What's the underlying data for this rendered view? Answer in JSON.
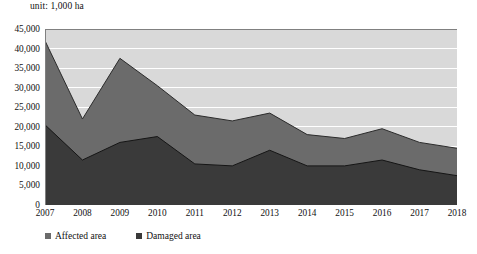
{
  "unit_label": "unit: 1,000 ha",
  "legend": {
    "items": [
      {
        "label": "Affected area",
        "color": "#6b6b6b",
        "swatch_icon": "square-marker-icon"
      },
      {
        "label": "Damaged area",
        "color": "#3a3a3a",
        "swatch_icon": "square-marker-icon"
      }
    ]
  },
  "axis": {
    "y_ticks": [
      "45,000",
      "40,000",
      "35,000",
      "30,000",
      "25,000",
      "20,000",
      "15,000",
      "10,000",
      "5,000",
      "0"
    ],
    "x_ticks": [
      "2007",
      "2008",
      "2009",
      "2010",
      "2011",
      "2012",
      "2013",
      "2014",
      "2015",
      "2016",
      "2017",
      "2018"
    ]
  },
  "chart_data": {
    "type": "area",
    "title": "",
    "subtitle": "",
    "xlabel": "",
    "ylabel": "",
    "unit": "unit: 1,000 ha",
    "stacked": false,
    "overlap": true,
    "grid": true,
    "legend_position": "bottom-left",
    "ylim": [
      0,
      45000
    ],
    "ytick_step": 5000,
    "categories": [
      "2007",
      "2008",
      "2009",
      "2010",
      "2011",
      "2012",
      "2013",
      "2014",
      "2015",
      "2016",
      "2017",
      "2018"
    ],
    "series": [
      {
        "name": "Affected area",
        "color": "#6b6b6b",
        "values": [
          42000,
          22000,
          37500,
          30500,
          23000,
          21500,
          23500,
          18000,
          17000,
          19500,
          16000,
          14500
        ]
      },
      {
        "name": "Damaged area",
        "color": "#3a3a3a",
        "values": [
          20500,
          11500,
          16000,
          17500,
          10500,
          10000,
          14000,
          10000,
          10000,
          11500,
          9000,
          7500
        ]
      }
    ]
  },
  "colors": {
    "plot_background": "#d9d9d9",
    "affected_fill": "#6b6b6b",
    "damaged_fill": "#3a3a3a",
    "gridline": "#ffffff",
    "axis_line": "#808080",
    "text": "#111111"
  }
}
